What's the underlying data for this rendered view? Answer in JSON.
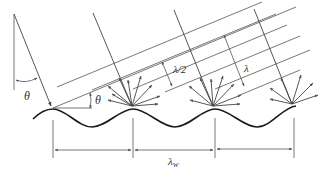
{
  "diagram": {
    "type": "grating-diffraction-schematic",
    "labels": {
      "theta_left": "θ",
      "theta_right": "θ",
      "half_wavelength": "λ/2",
      "wavelength": "λ",
      "wave_period": "λ",
      "wave_period_sub": "W"
    },
    "colors": {
      "line": "#555555",
      "wave": "#1a1a1a",
      "text": "#333333",
      "background": "#ffffff"
    }
  }
}
